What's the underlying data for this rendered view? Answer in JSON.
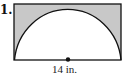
{
  "problem": {
    "number": "1.",
    "diameter_label": "14 in."
  },
  "figure": {
    "shape": "semicircle inscribed in rectangle",
    "shaded_color": "#c8c8c8",
    "stroke_color": "#111111"
  }
}
